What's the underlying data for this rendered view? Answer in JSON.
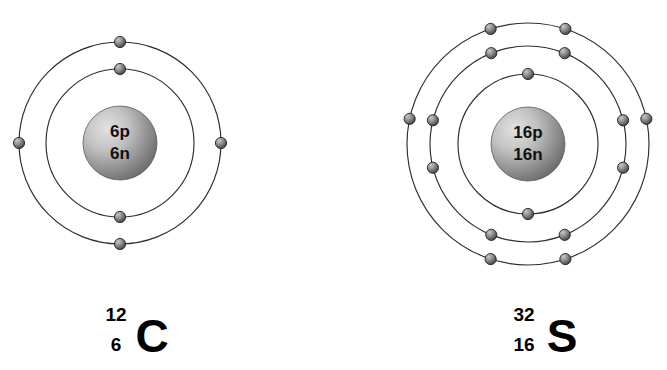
{
  "figure": {
    "background_color": "#ffffff",
    "shell_stroke_color": "#2e2e2e",
    "electron_color_light": "#b9b9b9",
    "electron_color_dark": "#3d3d3d",
    "nucleus_color_light": "#d8d8d8",
    "nucleus_color_dark": "#6f6f6f",
    "label_color": "#000000"
  },
  "atoms": [
    {
      "id": "carbon",
      "element_name": "Carbon",
      "symbol": "C",
      "mass_number": "12",
      "atomic_number": "6",
      "nucleus": {
        "protons_label": "6p",
        "neutrons_label": "6n",
        "center_x": 120,
        "center_y": 143,
        "radius": 37
      },
      "shells": [
        {
          "name": "inner-shell",
          "index": 1,
          "radius": 74,
          "electron_count": 2,
          "electron_angles_deg": [
            90,
            270
          ]
        },
        {
          "name": "outer-shell",
          "index": 2,
          "radius": 101,
          "electron_count": 4,
          "electron_angles_deg": [
            90,
            270,
            0,
            180
          ]
        }
      ],
      "total_electrons": 6,
      "label": {
        "mass_number": "12",
        "atomic_number": "6",
        "symbol": "C",
        "symbol_x": 152,
        "symbol_y": 352,
        "mass_x": 116,
        "mass_y": 321,
        "number_x": 116,
        "number_y": 351
      }
    },
    {
      "id": "sulfur",
      "element_name": "Sulfur",
      "symbol": "S",
      "mass_number": "32",
      "atomic_number": "16",
      "nucleus": {
        "protons_label": "16p",
        "neutrons_label": "16n",
        "center_x": 528,
        "center_y": 144,
        "radius": 37
      },
      "shells": [
        {
          "name": "inner-shell",
          "index": 1,
          "radius": 70,
          "electron_count": 2,
          "electron_angles_deg": [
            90,
            270
          ]
        },
        {
          "name": "middle-shell",
          "index": 2,
          "radius": 98,
          "electron_count": 8,
          "electron_angles_deg": [
            68,
            112,
            248,
            292,
            14,
            346,
            166,
            194
          ]
        },
        {
          "name": "outer-shell",
          "index": 3,
          "radius": 121,
          "electron_count": 6,
          "electron_angles_deg": [
            72,
            108,
            252,
            288,
            12,
            168
          ]
        }
      ],
      "total_electrons": 16,
      "label": {
        "mass_number": "32",
        "atomic_number": "16",
        "symbol": "S",
        "symbol_x": 562,
        "symbol_y": 352,
        "mass_x": 524,
        "mass_y": 321,
        "number_x": 524,
        "number_y": 351
      }
    }
  ]
}
